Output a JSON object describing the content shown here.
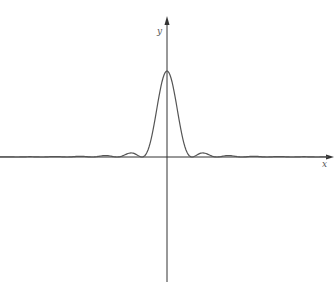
{
  "chart_data": {
    "type": "line",
    "title": "",
    "xlabel": "x",
    "ylabel": "y",
    "function": "sinc^2 (diffraction intensity pattern)",
    "grid": false,
    "legend": null,
    "xlim": [
      -6.7,
      6.7
    ],
    "ylim": [
      -1.45,
      1.1
    ],
    "x": [
      -6,
      -5,
      -4,
      -3,
      -2.5,
      -2,
      -1.5,
      -1,
      -0.5,
      0,
      0.5,
      1,
      1.5,
      2,
      2.5,
      3,
      4,
      5,
      6
    ],
    "values": [
      0.0,
      0.0,
      0.0,
      0.0,
      0.05,
      0.0,
      0.05,
      0.0,
      0.41,
      1.0,
      0.41,
      0.0,
      0.05,
      0.0,
      0.05,
      0.0,
      0.0,
      0.0,
      0.0
    ],
    "series": [
      {
        "name": "intensity",
        "color": "#555555"
      }
    ]
  },
  "axes": {
    "x_label": "x",
    "y_label": "y",
    "color": "#333333"
  }
}
